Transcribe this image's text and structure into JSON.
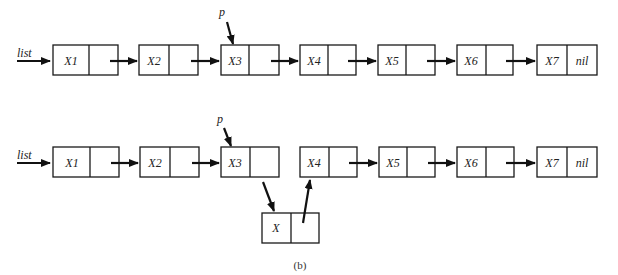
{
  "diagram": {
    "caption": "(b)",
    "colors": {
      "stroke": "#1a1a1a",
      "arrow": "#111111",
      "text": "#222222"
    },
    "top_list": {
      "head_label": "list",
      "pointer_label": "p",
      "pointer_target": "X3",
      "nodes": [
        {
          "info": "X1",
          "next": ""
        },
        {
          "info": "X2",
          "next": ""
        },
        {
          "info": "X3",
          "next": ""
        },
        {
          "info": "X4",
          "next": ""
        },
        {
          "info": "X5",
          "next": ""
        },
        {
          "info": "X6",
          "next": ""
        },
        {
          "info": "X7",
          "next": "nil"
        }
      ]
    },
    "bottom_list": {
      "head_label": "list",
      "pointer_label": "p",
      "pointer_target": "X3",
      "nodes": [
        {
          "info": "X1",
          "next": ""
        },
        {
          "info": "X2",
          "next": ""
        },
        {
          "info": "X3",
          "next": ""
        },
        {
          "info": "X4",
          "next": ""
        },
        {
          "info": "X5",
          "next": ""
        },
        {
          "info": "X6",
          "next": ""
        },
        {
          "info": "X7",
          "next": "nil"
        }
      ],
      "inserted_node": {
        "info": "X",
        "next": "",
        "inserted_after": "X3",
        "points_to": "X4"
      }
    }
  }
}
